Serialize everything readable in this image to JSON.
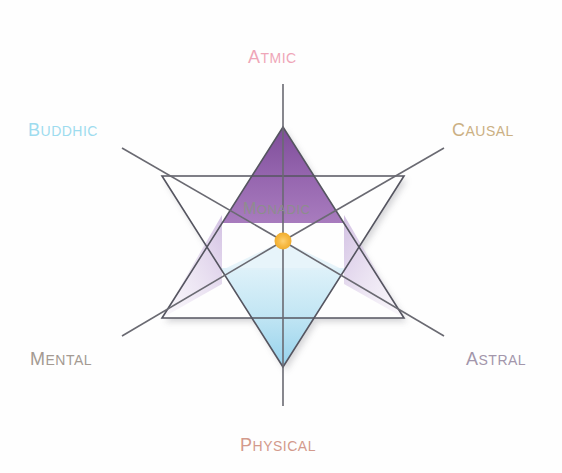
{
  "diagram": {
    "title_center": "Monadic",
    "type": "hexagram-planes-diagram",
    "center_point_color": "#f5b93c",
    "background": "#ffffff",
    "labels": [
      {
        "id": "atmic",
        "text": "Atmic",
        "color": "#efa6b8",
        "position": "top"
      },
      {
        "id": "buddhic",
        "text": "Buddhic",
        "color": "#9edcef",
        "position": "upper-left"
      },
      {
        "id": "causal",
        "text": "Causal",
        "color": "#cbb083",
        "position": "upper-right"
      },
      {
        "id": "mental",
        "text": "Mental",
        "color": "#a49a92",
        "position": "lower-left"
      },
      {
        "id": "astral",
        "text": "Astral",
        "color": "#a396ab",
        "position": "lower-right"
      },
      {
        "id": "physical",
        "text": "Physical",
        "color": "#d39a8c",
        "position": "bottom"
      },
      {
        "id": "monadic",
        "text": "Monadic",
        "color": "#8d8d8d",
        "position": "center"
      }
    ],
    "fills": {
      "top_point": "#9563ad",
      "bottom_point_top": "#cfeaf6",
      "bottom_point_bottom": "#9ed6ee",
      "side_points": "#d9cbe4",
      "stroke": "#555560"
    }
  }
}
